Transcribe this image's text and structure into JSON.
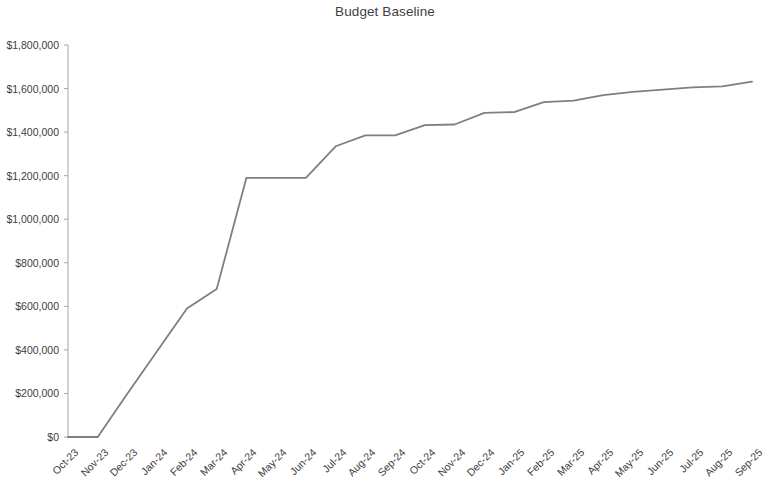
{
  "chart_data": {
    "type": "line",
    "title": "Budget Baseline",
    "xlabel": "",
    "ylabel": "",
    "ylim": [
      0,
      1800000
    ],
    "ytick_values": [
      0,
      200000,
      400000,
      600000,
      800000,
      1000000,
      1200000,
      1400000,
      1600000,
      1800000
    ],
    "ytick_labels": [
      "$0",
      "$200,000",
      "$400,000",
      "$600,000",
      "$800,000",
      "$1,000,000",
      "$1,200,000",
      "$1,400,000",
      "$1,600,000",
      "$1,800,000"
    ],
    "categories": [
      "Oct-23",
      "Nov-23",
      "Dec-23",
      "Jan-24",
      "Feb-24",
      "Mar-24",
      "Apr-24",
      "May-24",
      "Jun-24",
      "Jul-24",
      "Aug-24",
      "Sep-24",
      "Oct-24",
      "Nov-24",
      "Dec-24",
      "Jan-25",
      "Feb-25",
      "Mar-25",
      "Apr-25",
      "May-25",
      "Jun-25",
      "Jul-25",
      "Aug-25",
      "Sep-25"
    ],
    "series": [
      {
        "name": "Budget Baseline",
        "color": "#7f7f7f",
        "values": [
          0,
          0,
          200000,
          395000,
          590000,
          680000,
          1190000,
          1190000,
          1190000,
          1335000,
          1385000,
          1385000,
          1432000,
          1435000,
          1488000,
          1492000,
          1538000,
          1545000,
          1570000,
          1585000,
          1595000,
          1605000,
          1610000,
          1632000
        ]
      }
    ],
    "grid": false,
    "legend": false,
    "legend_position": "none",
    "axis_color": "#a6a6a6",
    "text_color": "#404040",
    "background": "#ffffff"
  }
}
